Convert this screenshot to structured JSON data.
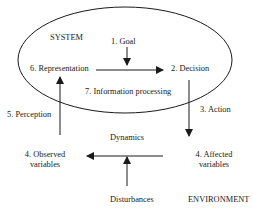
{
  "diagram": {
    "system_label": "SYSTEM",
    "environment_label": "ENVIRONMENT",
    "nodes": {
      "goal": "1. Goal",
      "decision": "2. Decision",
      "action": "3. Action",
      "affected_line1": "4. Affected",
      "affected_line2": "variables",
      "observed_line1": "4. Observed",
      "observed_line2": "variables",
      "perception": "5. Perception",
      "representation": "6. Representation",
      "information_processing": "7. Information processing",
      "dynamics": "Dynamics",
      "disturbances": "Disturbances"
    },
    "colors": {
      "stroke": "#1a1a1a",
      "background": "#ffffff"
    }
  }
}
